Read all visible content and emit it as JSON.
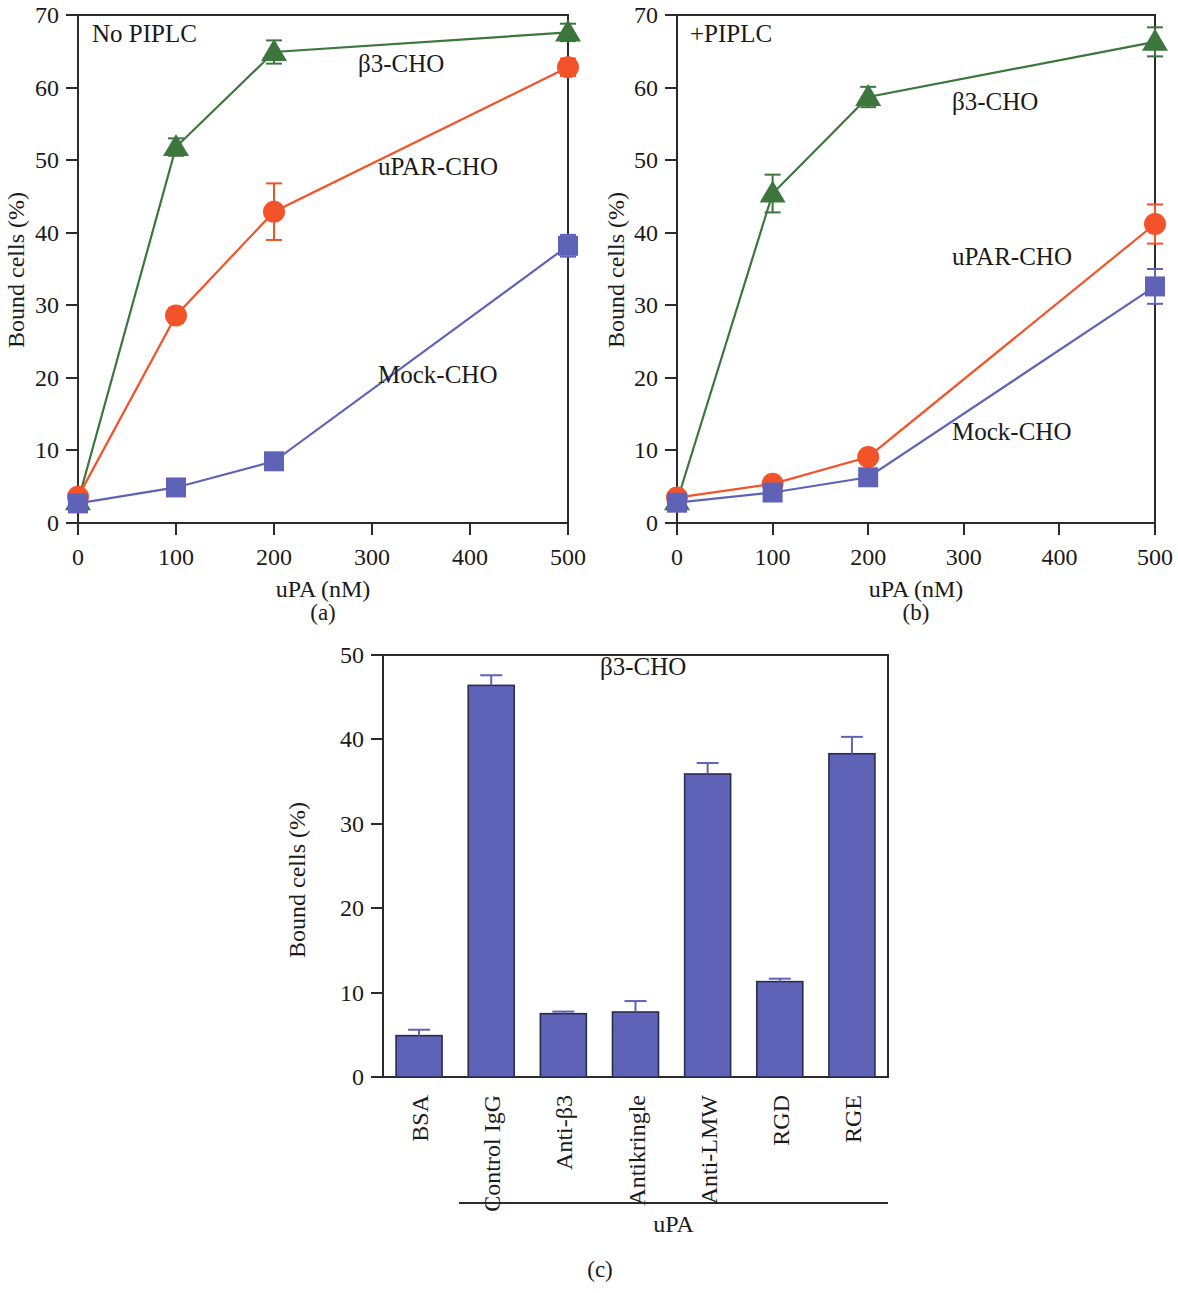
{
  "figure": {
    "panel_captions": [
      "(a)",
      "(b)",
      "(c)"
    ]
  },
  "panel_a": {
    "note": "No PIPLC",
    "xlabel": "uPA (nM)",
    "ylabel": "Bound cells (%)",
    "xticks": [
      "0",
      "100",
      "200",
      "300",
      "400",
      "500"
    ],
    "yticks": [
      "0",
      "10",
      "20",
      "30",
      "40",
      "50",
      "60",
      "70"
    ],
    "series_labels": {
      "beta3": "β3-CHO",
      "upar": "uPAR-CHO",
      "mock": "Mock-CHO"
    }
  },
  "panel_b": {
    "note": "+PIPLC",
    "xlabel": "uPA (nM)",
    "ylabel": "Bound cells (%)",
    "xticks": [
      "0",
      "100",
      "200",
      "300",
      "400",
      "500"
    ],
    "yticks": [
      "0",
      "10",
      "20",
      "30",
      "40",
      "50",
      "60",
      "70"
    ],
    "series_labels": {
      "beta3": "β3-CHO",
      "upar": "uPAR-CHO",
      "mock": "Mock-CHO"
    }
  },
  "panel_c": {
    "note": "β3-CHO",
    "ylabel": "Bound cells (%)",
    "yticks": [
      "0",
      "10",
      "20",
      "30",
      "40",
      "50"
    ],
    "group_label": "uPA"
  },
  "colors": {
    "beta3": "#3c763c",
    "upar": "#f4532a",
    "mock": "#5f63b8",
    "bar_fill": "#5f63b8",
    "bar_stroke": "#2b2b4f",
    "axis": "#2b2b2b"
  },
  "chart_data": [
    {
      "type": "line",
      "id": "panel-a",
      "title": "No PIPLC",
      "xlabel": "uPA (nM)",
      "ylabel": "Bound cells (%)",
      "xlim": [
        0,
        500
      ],
      "ylim": [
        0,
        70
      ],
      "xticks": [
        0,
        100,
        200,
        300,
        400,
        500
      ],
      "yticks": [
        0,
        10,
        20,
        30,
        40,
        50,
        60,
        70
      ],
      "grid": false,
      "legend": "inline-annotations",
      "x": [
        0,
        100,
        200,
        500
      ],
      "series": [
        {
          "name": "β3-CHO",
          "marker": "triangle",
          "color": "#3c763c",
          "values": [
            3.0,
            51.8,
            64.9,
            67.6
          ],
          "errors": [
            0.6,
            1.2,
            1.6,
            1.2
          ]
        },
        {
          "name": "uPAR-CHO",
          "marker": "circle",
          "color": "#f4532a",
          "values": [
            3.6,
            28.6,
            42.9,
            62.8
          ],
          "errors": [
            0.5,
            1.0,
            3.9,
            1.2
          ]
        },
        {
          "name": "Mock-CHO",
          "marker": "square",
          "color": "#5f63b8",
          "values": [
            2.7,
            4.9,
            8.5,
            38.2
          ],
          "errors": [
            0.4,
            0.6,
            0.8,
            1.5
          ]
        }
      ]
    },
    {
      "type": "line",
      "id": "panel-b",
      "title": "+PIPLC",
      "xlabel": "uPA (nM)",
      "ylabel": "Bound cells (%)",
      "xlim": [
        0,
        500
      ],
      "ylim": [
        0,
        70
      ],
      "xticks": [
        0,
        100,
        200,
        300,
        400,
        500
      ],
      "yticks": [
        0,
        10,
        20,
        30,
        40,
        50,
        60,
        70
      ],
      "grid": false,
      "legend": "inline-annotations",
      "x": [
        0,
        100,
        200,
        500
      ],
      "series": [
        {
          "name": "β3-CHO",
          "marker": "triangle",
          "color": "#3c763c",
          "values": [
            3.0,
            45.4,
            58.7,
            66.3
          ],
          "errors": [
            0.5,
            2.6,
            1.4,
            2.0
          ]
        },
        {
          "name": "uPAR-CHO",
          "marker": "circle",
          "color": "#f4532a",
          "values": [
            3.5,
            5.4,
            9.1,
            41.2
          ],
          "errors": [
            0.5,
            0.6,
            0.6,
            2.7
          ]
        },
        {
          "name": "Mock-CHO",
          "marker": "square",
          "color": "#5f63b8",
          "values": [
            2.8,
            4.2,
            6.3,
            32.6
          ],
          "errors": [
            0.4,
            0.5,
            0.6,
            2.4
          ]
        }
      ]
    },
    {
      "type": "bar",
      "id": "panel-c",
      "title": "β3-CHO",
      "xlabel": "uPA",
      "ylabel": "Bound cells (%)",
      "ylim": [
        0,
        50
      ],
      "yticks": [
        0,
        10,
        20,
        30,
        40,
        50
      ],
      "grid": false,
      "categories": [
        "BSA",
        "Control IgG",
        "Anti-β3",
        "Antikringle",
        "Anti-LMW",
        "RGD",
        "RGE"
      ],
      "values": [
        4.9,
        46.4,
        7.5,
        7.7,
        35.9,
        11.3,
        38.3
      ],
      "errors": [
        0.7,
        1.2,
        0.25,
        1.3,
        1.3,
        0.35,
        2.0
      ],
      "bar_color": "#5f63b8",
      "group_bracket": {
        "label": "uPA",
        "covers": [
          "Control IgG",
          "Anti-β3",
          "Antikringle",
          "Anti-LMW",
          "RGD",
          "RGE"
        ]
      }
    }
  ]
}
